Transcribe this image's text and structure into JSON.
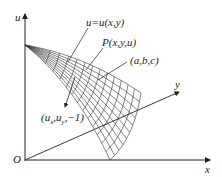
{
  "diagram": {
    "axes": {
      "u_label": "u",
      "x_label": "x",
      "y_label": "y",
      "origin_label": "O"
    },
    "annotations": {
      "surface_equation": "u=u(x,y)",
      "point": "P(x,y,u)",
      "direction_vector": "(a,b,c)",
      "normal_vector_prefix": "(u",
      "normal_sub_x": "x",
      "normal_mid": ",u",
      "normal_sub_y": "y",
      "normal_suffix": ",−1)"
    },
    "colors": {
      "line": "#222222",
      "mesh": "#333333",
      "background": "#ffffff"
    }
  }
}
